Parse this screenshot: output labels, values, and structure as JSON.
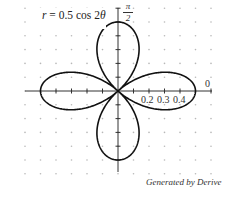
{
  "chart_data": {
    "type": "line",
    "subtype": "polar",
    "title": "r = 0.5 cos 2θ",
    "equation": "r = 0.5 cos 2θ",
    "function": {
      "a": 0.5,
      "k": 2,
      "form": "r = a cos(kθ)",
      "theta_range": [
        0,
        6.2832
      ]
    },
    "polar_axis_label": "0",
    "vertical_axis_label": {
      "numerator": "π",
      "denominator": "2"
    },
    "x_tick_labels": [
      "0.2",
      "0.3",
      "0.4"
    ],
    "x_ticks": [
      0.1,
      0.2,
      0.3,
      0.4,
      0.5
    ],
    "xlim": [
      -0.59,
      0.6
    ],
    "ylim": [
      -0.58,
      0.6
    ],
    "grid": "dots",
    "grid_step": 0.1,
    "legend": null,
    "credit": "Generated by Derive",
    "colors": {
      "curve": "#111111",
      "axis": "#333333",
      "grid_dot": "#b8b8b8"
    }
  },
  "labels": {
    "equation_r": "r",
    "equation_rest": " = 0.5 cos 2",
    "equation_theta": "θ",
    "pi_num": "π",
    "pi_den": "2",
    "zero": "0",
    "tick_02": "0.2",
    "tick_03": "0.3",
    "tick_04": "0.4",
    "credit": "Generated by Derive"
  }
}
